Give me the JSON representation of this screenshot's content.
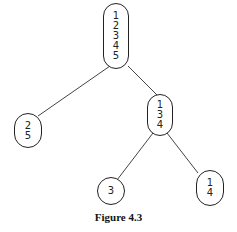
{
  "diagram": {
    "type": "tree",
    "nodes": [
      {
        "id": "root",
        "values": [
          "1",
          "2",
          "3",
          "4",
          "5"
        ]
      },
      {
        "id": "left",
        "values": [
          "2",
          "5"
        ]
      },
      {
        "id": "right",
        "values": [
          "1",
          "3",
          "4"
        ]
      },
      {
        "id": "right-left",
        "values": [
          "3"
        ]
      },
      {
        "id": "right-right",
        "values": [
          "1",
          "4"
        ]
      }
    ],
    "edges": [
      [
        "root",
        "left"
      ],
      [
        "root",
        "right"
      ],
      [
        "right",
        "right-left"
      ],
      [
        "right",
        "right-right"
      ]
    ]
  },
  "caption": "Figure 4.3"
}
